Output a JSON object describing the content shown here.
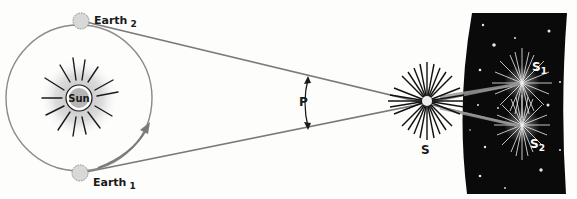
{
  "diagram": {
    "type": "stellar-parallax",
    "labels": {
      "sun": "Sun",
      "earth1": "Earth",
      "earth1_sub": "1",
      "earth2": "Earth",
      "earth2_sub": "2",
      "parallax_angle": "P",
      "star": "S",
      "apparent1": "S",
      "apparent1_sub": "1",
      "apparent2": "S",
      "apparent2_sub": "2"
    },
    "colors": {
      "sight_lines": "#7a7a7a",
      "orbit": "#8a8a8a",
      "sky_background": "#0a0a0a",
      "ink": "#1a1a1a"
    }
  }
}
